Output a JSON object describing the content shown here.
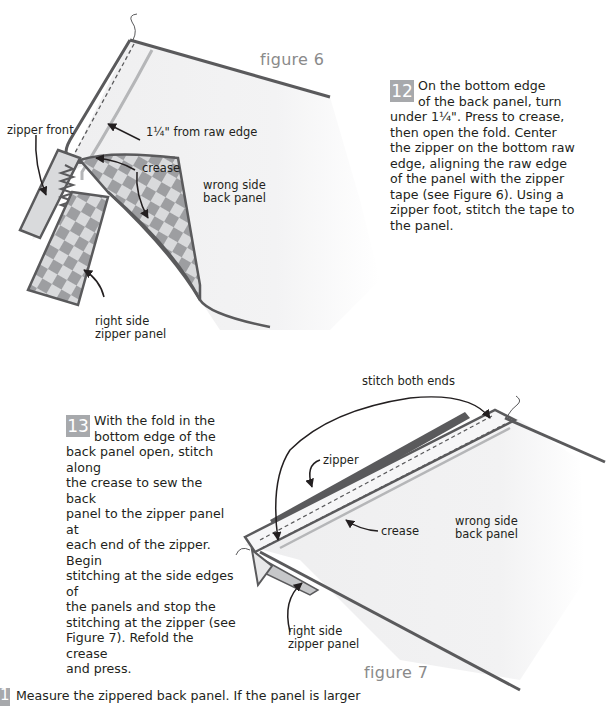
{
  "figure6": {
    "title": "figure 6",
    "labels": {
      "measure": "1¼\" from raw edge",
      "crease": "crease",
      "zipper_front": "zipper front",
      "wrong_side_1": "wrong side",
      "wrong_side_2": "back panel",
      "right_side_1": "right side",
      "right_side_2": "zipper panel"
    }
  },
  "figure7": {
    "title": "figure 7",
    "labels": {
      "stitch_both_ends": "stitch both ends",
      "zipper": "zipper",
      "crease": "crease",
      "wrong_side_1": "wrong side",
      "wrong_side_2": "back panel",
      "right_side_1": "right side",
      "right_side_2": "zipper panel"
    }
  },
  "steps": [
    {
      "number": "12",
      "lines": [
        "On the bottom edge",
        "of the back panel, turn",
        "under 1¼\". Press to crease,",
        "then open the fold. Center",
        "the zipper on the bottom raw",
        "edge, aligning the raw edge",
        "of the panel with the zipper",
        "tape (see Figure 6). Using a",
        "zipper foot, stitch the tape to",
        "the panel."
      ]
    },
    {
      "number": "13",
      "lines": [
        "With the fold in the",
        "bottom edge of the",
        "back panel open, stitch along",
        "the crease to sew the back",
        "panel to the zipper panel at",
        "each end of the zipper. Begin",
        "stitching at the side edges of",
        "the panels and stop the",
        "stitching at the zipper (see",
        "Figure 7). Refold the crease",
        "and press."
      ]
    },
    {
      "number": "14",
      "text": "Measure the zippered back panel. If the panel is larger"
    }
  ],
  "colors": {
    "outline": "#5a5a5c",
    "fabric": "#f1f1f2",
    "crease": "#b5b6b8",
    "check_dark": "#8e8f92",
    "check_light": "#d9dadc",
    "badge": "#a7a9ac"
  }
}
